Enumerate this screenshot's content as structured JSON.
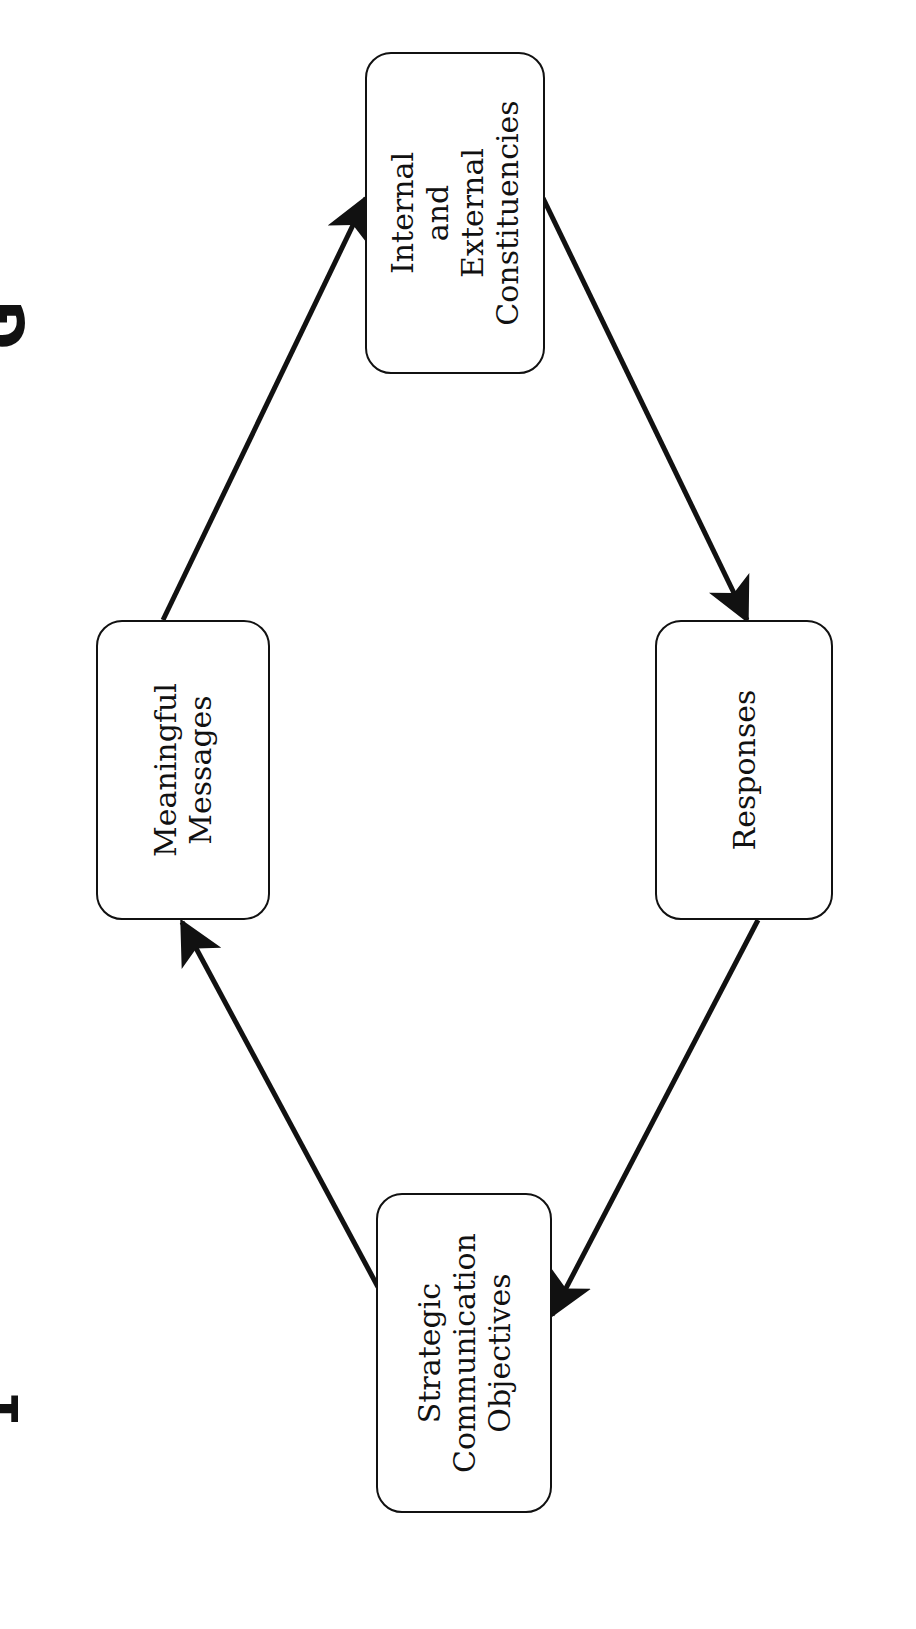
{
  "diagram": {
    "orientation": "rotated-90-ccw",
    "nodes": [
      {
        "id": "meaningful",
        "label": "Meaningful\nMessages"
      },
      {
        "id": "internal",
        "label": "Internal\nand\nExternal\nConstituencies"
      },
      {
        "id": "responses",
        "label": "Responses"
      },
      {
        "id": "strategic",
        "label": "Strategic\nCommunication\nObjectives"
      }
    ],
    "edges": [
      {
        "from": "strategic",
        "to": "meaningful"
      },
      {
        "from": "meaningful",
        "to": "internal"
      },
      {
        "from": "internal",
        "to": "responses"
      },
      {
        "from": "responses",
        "to": "strategic"
      }
    ],
    "edge_fragments": {
      "top": "G",
      "bottom": "1"
    },
    "colors": {
      "stroke": "#111111",
      "background": "#ffffff"
    }
  }
}
